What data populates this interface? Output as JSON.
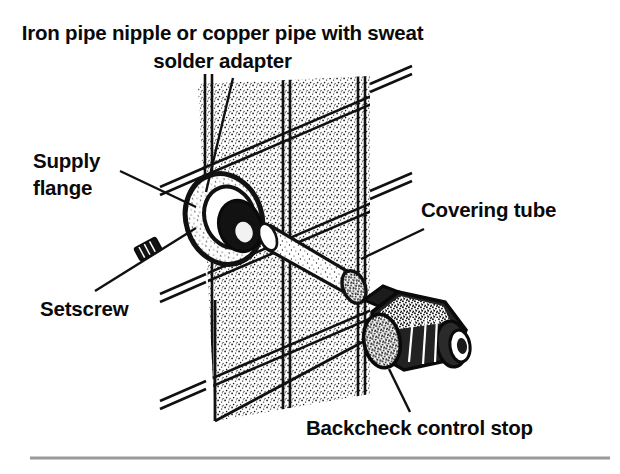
{
  "figure": {
    "kind": "technical-line-illustration",
    "width": 620,
    "height": 474,
    "background_color": "#ffffff",
    "ink_color": "#111111"
  },
  "labels": {
    "title": "Iron pipe nipple or copper pipe with sweat solder adapter",
    "supply_flange": "Supply\nflange",
    "supply_flange_line1": "Supply",
    "supply_flange_line2": "flange",
    "setscrew": "Setscrew",
    "covering_tube": "Covering tube",
    "backcheck": "Backcheck control stop"
  },
  "callouts": [
    {
      "name": "iron-pipe-nipple",
      "text": "Iron pipe nipple or copper pipe with sweat solder adapter",
      "leader_from": [
        233,
        78
      ],
      "leader_to": [
        206,
        192
      ]
    },
    {
      "name": "supply-flange",
      "text": "Supply flange",
      "leader_from": [
        120,
        171
      ],
      "leader_to": [
        196,
        207
      ]
    },
    {
      "name": "setscrew",
      "text": "Setscrew",
      "leader_from": [
        95,
        291
      ],
      "leader_to": [
        196,
        228
      ]
    },
    {
      "name": "covering-tube",
      "text": "Covering tube",
      "leader_from": [
        424,
        229
      ],
      "leader_to": [
        361,
        259
      ]
    },
    {
      "name": "backcheck-control-stop",
      "text": "Backcheck control stop",
      "leader_from": [
        410,
        412
      ],
      "leader_to": [
        389,
        369
      ]
    }
  ],
  "parts": [
    {
      "name": "tiled-wall",
      "description": "Isometric tiled wall with grout grid and stipple texture"
    },
    {
      "name": "supply-flange",
      "description": "Escutcheon flange ring at pipe penetration"
    },
    {
      "name": "pipe-nipple",
      "description": "Dark iron pipe nipple / copper pipe stub through flange"
    },
    {
      "name": "setscrew",
      "description": "Small threaded setscrew"
    },
    {
      "name": "covering-tube",
      "description": "Cylindrical chrome covering tube"
    },
    {
      "name": "backcheck-control-stop",
      "description": "Angle stop valve body with caps"
    }
  ],
  "rule": {
    "name": "bottom-divider",
    "color": "#9a9a9a",
    "y": 458,
    "x_start": 30,
    "x_end": 610
  }
}
